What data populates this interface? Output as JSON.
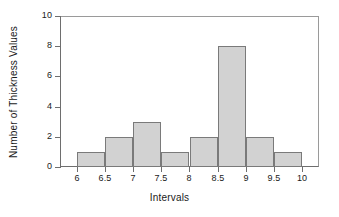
{
  "chart_data": {
    "type": "bar",
    "title": "",
    "subtitle": "",
    "xlabel": "Intervals",
    "ylabel": "Number of Thickness Values",
    "bin_edges": [
      6,
      6.5,
      7,
      7.5,
      8,
      8.5,
      9,
      9.5,
      10
    ],
    "categories": [
      "6-6.5",
      "6.5-7",
      "7-7.5",
      "7.5-8",
      "8-8.5",
      "8.5-9",
      "9-9.5",
      "9.5-10"
    ],
    "values": [
      1,
      2,
      3,
      1,
      2,
      8,
      2,
      1
    ],
    "xlim": [
      5.7,
      10.3
    ],
    "ylim": [
      0,
      10
    ],
    "xticks": [
      6,
      6.5,
      7,
      7.5,
      8,
      8.5,
      9,
      9.5,
      10
    ],
    "xtick_labels": [
      "6",
      "6.5",
      "7",
      "7.5",
      "8",
      "8.5",
      "9",
      "9.5",
      "10"
    ],
    "yticks": [
      0,
      2,
      4,
      6,
      8,
      10
    ],
    "ytick_labels": [
      "0",
      "2",
      "4",
      "6",
      "8",
      "10"
    ],
    "grid": false,
    "legend": null,
    "bar_fill_color": "#d2d2d2",
    "bar_edge_color": "#7a7a7a",
    "axis_color": "#6e6e6e",
    "text_color": "#1a1a1a",
    "background_color": "#ffffff"
  }
}
